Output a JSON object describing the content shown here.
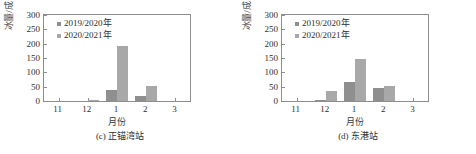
{
  "figure": {
    "panels": [
      {
        "caption": "(c) 正锚湾站",
        "xlabel": "月份",
        "ylabel": "冰量/成",
        "legend": [
          "2019/2020年",
          "2020/2021年"
        ],
        "yticks": [
          "0",
          "50",
          "100",
          "150",
          "200",
          "250",
          "300"
        ],
        "xticks": [
          "11",
          "12",
          "1",
          "2",
          "3"
        ],
        "chart_data": {
          "type": "bar",
          "title": "(c) 正锚湾站",
          "xlabel": "月份",
          "ylabel": "冰量/成",
          "categories": [
            "11",
            "12",
            "1",
            "2",
            "3"
          ],
          "series": [
            {
              "name": "2019/2020年",
              "values": [
                0,
                0,
                40,
                18,
                0
              ],
              "color": "#8f8f8f"
            },
            {
              "name": "2020/2021年",
              "values": [
                0,
                5,
                192,
                52,
                0
              ],
              "color": "#a8a8a8"
            }
          ],
          "ylim": [
            0,
            300
          ],
          "ytick_step": 50,
          "grid": false,
          "legend_position": "top-left"
        }
      },
      {
        "caption": "(d) 东港站",
        "xlabel": "月份",
        "ylabel": "冰量/成",
        "legend": [
          "2019/2020年",
          "2020/2021年"
        ],
        "yticks": [
          "0",
          "50",
          "100",
          "150",
          "200",
          "250",
          "300"
        ],
        "xticks": [
          "11",
          "12",
          "1",
          "2",
          "3"
        ],
        "chart_data": {
          "type": "bar",
          "title": "(d) 东港站",
          "xlabel": "月份",
          "ylabel": "冰量/成",
          "categories": [
            "11",
            "12",
            "1",
            "2",
            "3"
          ],
          "series": [
            {
              "name": "2019/2020年",
              "values": [
                0,
                3,
                67,
                46,
                0
              ],
              "color": "#8f8f8f"
            },
            {
              "name": "2020/2021年",
              "values": [
                0,
                36,
                145,
                54,
                0
              ],
              "color": "#a8a8a8"
            }
          ],
          "ylim": [
            0,
            300
          ],
          "ytick_step": 50,
          "grid": false,
          "legend_position": "top-left"
        }
      }
    ]
  },
  "chart_data": [
    {
      "type": "bar",
      "title": "(c) 正锚湾站",
      "xlabel": "月份",
      "ylabel": "冰量/成",
      "categories": [
        "11",
        "12",
        "1",
        "2",
        "3"
      ],
      "series": [
        {
          "name": "2019/2020年",
          "values": [
            0,
            0,
            40,
            18,
            0
          ]
        },
        {
          "name": "2020/2021年",
          "values": [
            0,
            5,
            192,
            52,
            0
          ]
        }
      ],
      "ylim": [
        0,
        300
      ],
      "ytick_step": 50,
      "grid": false,
      "legend_position": "top-left"
    },
    {
      "type": "bar",
      "title": "(d) 东港站",
      "xlabel": "月份",
      "ylabel": "冰量/成",
      "categories": [
        "11",
        "12",
        "1",
        "2",
        "3"
      ],
      "series": [
        {
          "name": "2019/2020年",
          "values": [
            0,
            3,
            67,
            46,
            0
          ]
        },
        {
          "name": "2020/2021年",
          "values": [
            0,
            36,
            145,
            54,
            0
          ]
        }
      ],
      "ylim": [
        0,
        300
      ],
      "ytick_step": 50,
      "grid": false,
      "legend_position": "top-left"
    }
  ]
}
